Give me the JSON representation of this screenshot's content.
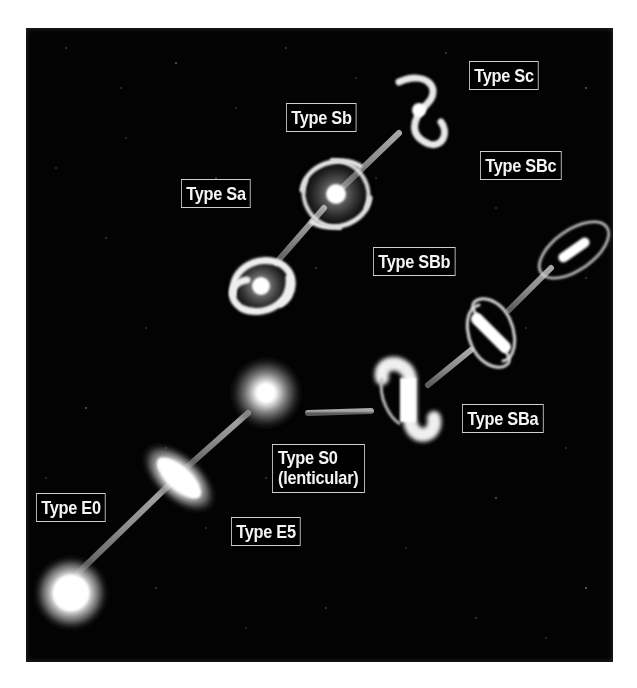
{
  "diagram": {
    "type": "hubble-tuning-fork",
    "background_color": "#030303",
    "connector_color": "#8a8a8a",
    "label_border_color": "#cfcfcf",
    "label_text_color": "#f4f4f4"
  },
  "labels": {
    "e0": "Type E0",
    "e5": "Type E5",
    "s0_line1": "Type S0",
    "s0_line2": "(lenticular)",
    "sa": "Type Sa",
    "sb": "Type Sb",
    "sc": "Type Sc",
    "sba": "Type SBa",
    "sbb": "Type SBb",
    "sbc": "Type SBc"
  },
  "branches": {
    "elliptical": [
      "Type E0",
      "Type E5"
    ],
    "junction": "Type S0 (lenticular)",
    "spiral": [
      "Type Sa",
      "Type Sb",
      "Type Sc"
    ],
    "barred_spiral": [
      "Type SBa",
      "Type SBb",
      "Type SBc"
    ]
  }
}
